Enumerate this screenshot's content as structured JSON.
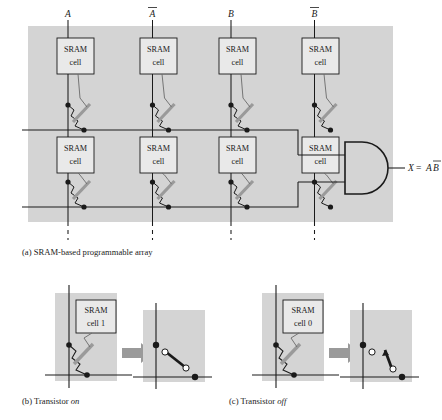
{
  "figure": {
    "background_color": "#d4d4d4",
    "line_color": "#1a1a1a",
    "gate_bar_color": "#9a9a9a",
    "arrow_color": "#9a9a9a"
  },
  "panel_a": {
    "caption": "(a) SRAM-based programmable array",
    "column_labels": [
      "A",
      "A",
      "B",
      "B"
    ],
    "column_overbar": [
      false,
      true,
      false,
      true
    ],
    "cell_label_line1": "SRAM",
    "cell_label_line2": "cell",
    "cells": [
      {
        "row": 1,
        "col": 1,
        "line1": "SRAM",
        "line2": "cell"
      },
      {
        "row": 1,
        "col": 2,
        "line1": "SRAM",
        "line2": "cell"
      },
      {
        "row": 1,
        "col": 3,
        "line1": "SRAM",
        "line2": "cell"
      },
      {
        "row": 1,
        "col": 4,
        "line1": "SRAM",
        "line2": "cell"
      },
      {
        "row": 2,
        "col": 1,
        "line1": "SRAM",
        "line2": "cell"
      },
      {
        "row": 2,
        "col": 2,
        "line1": "SRAM",
        "line2": "cell"
      },
      {
        "row": 2,
        "col": 3,
        "line1": "SRAM",
        "line2": "cell"
      },
      {
        "row": 2,
        "col": 4,
        "line1": "SRAM",
        "line2": "cell"
      }
    ],
    "gate": {
      "type": "AND",
      "inputs": 2
    },
    "output": {
      "x": "X",
      "equals": "=",
      "a": "A",
      "b": "B",
      "b_overbar": true,
      "text": "X = AB̅"
    }
  },
  "panel_b": {
    "caption_prefix": "(b) Transistor ",
    "caption_state": "on",
    "cell_line1": "SRAM",
    "cell_line2": "cell 1",
    "switch_state": "closed"
  },
  "panel_c": {
    "caption_prefix": "(c) Transistor ",
    "caption_state": "off",
    "cell_line1": "SRAM",
    "cell_line2": "cell 0",
    "switch_state": "open"
  }
}
